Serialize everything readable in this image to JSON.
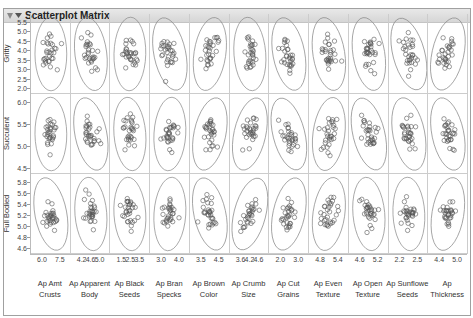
{
  "window": {
    "title": "Scatterplot Matrix"
  },
  "icons": {
    "collapse": "disclosure-triangle-icon",
    "menu": "red-triangle-menu-icon"
  },
  "chart_data": {
    "type": "scatter",
    "title": "Scatterplot Matrix",
    "rows": [
      {
        "name": "Gritty",
        "ticks": [
          "5.5",
          "5.0",
          "4.5",
          "4.0",
          "3.5",
          "3.0",
          "2.5",
          "2.0"
        ],
        "range": [
          1.8,
          5.8
        ]
      },
      {
        "name": "Succulent",
        "ticks": [
          "6.0",
          "5.5",
          "5.0",
          "4.5"
        ],
        "range": [
          4.2,
          6.3
        ]
      },
      {
        "name": "Full Bodied",
        "ticks": [
          "5.8",
          "5.6",
          "5.4",
          "5.2",
          "5.0",
          "4.8",
          "4.6"
        ],
        "range": [
          4.55,
          5.9
        ]
      }
    ],
    "columns": [
      {
        "name": "Ap Amt Crusts",
        "label_lines": [
          "Ap Amt",
          "Crusts"
        ],
        "ticks": [
          "6.0",
          "7.5"
        ]
      },
      {
        "name": "Ap Apparent Body",
        "label_lines": [
          "Ap Apparent",
          "Body"
        ],
        "ticks": [
          "4.2",
          "4.6",
          "5.0"
        ]
      },
      {
        "name": "Ap Black Seeds",
        "label_lines": [
          "Ap Black",
          "Seeds"
        ],
        "ticks": [
          "1.5",
          "2.5",
          "3.5"
        ]
      },
      {
        "name": "Ap Bran Specks",
        "label_lines": [
          "Ap Bran",
          "Specks"
        ],
        "ticks": [
          "3.0",
          "4.0"
        ]
      },
      {
        "name": "Ap Brown Color",
        "label_lines": [
          "Ap Brown",
          "Color"
        ],
        "ticks": [
          "3.5",
          "4.5"
        ]
      },
      {
        "name": "Ap Crumb Size",
        "label_lines": [
          "Ap Crumb",
          "Size"
        ],
        "ticks": [
          "3.6",
          "4.2",
          "4.6"
        ]
      },
      {
        "name": "Ap Cut Grains",
        "label_lines": [
          "Ap Cut",
          "Grains"
        ],
        "ticks": [
          "2.0",
          "3.0"
        ]
      },
      {
        "name": "Ap Even Texture",
        "label_lines": [
          "Ap Even",
          "Texture"
        ],
        "ticks": [
          "4.8",
          "5.4"
        ]
      },
      {
        "name": "Ap Open Texture",
        "label_lines": [
          "Ap Open",
          "Texture"
        ],
        "ticks": [
          "4.6",
          "5.2"
        ]
      },
      {
        "name": "Ap Sunflower Seeds",
        "label_lines": [
          "Ap Sunflowe",
          "Seeds"
        ],
        "ticks": [
          "2.2",
          "2.5"
        ]
      },
      {
        "name": "Ap Thickness",
        "label_lines": [
          "Ap",
          "Thickness"
        ],
        "ticks": [
          "4.4",
          "5.0"
        ]
      }
    ],
    "ellipses": "95% density ellipse per cell",
    "marker": "open circle",
    "points_per_cell": 30,
    "grid": false,
    "legend": "none"
  }
}
